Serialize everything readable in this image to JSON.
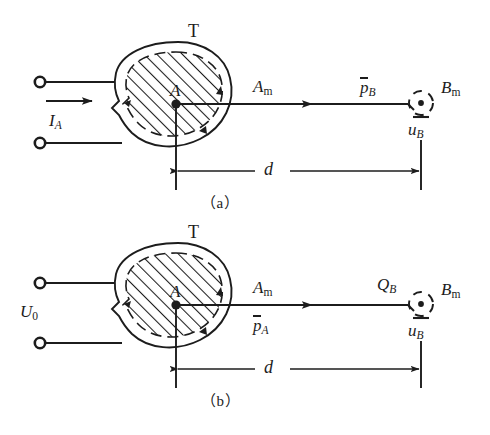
{
  "figure": {
    "type": "technical-diagram",
    "background_color": "#ffffff",
    "line_color": "#1c1c1c"
  },
  "panel_a": {
    "caption": "（a）",
    "transmitter_label": "T",
    "center_point_label": "A",
    "source_label": "I",
    "source_subscript": "A",
    "has_source_arrow": true,
    "ray_label": "A",
    "ray_subscript": "m",
    "power_label": "p",
    "power_subscript": "B",
    "power_overbar": true,
    "receiver_label": "B",
    "receiver_subscript": "m",
    "voltage_label": "u",
    "voltage_subscript": "B",
    "voltage_overbar": true,
    "distance_label": "d"
  },
  "panel_b": {
    "caption": "（b）",
    "transmitter_label": "T",
    "center_point_label": "A",
    "source_label": "U",
    "source_subscript": "0",
    "has_source_arrow": false,
    "ray_label": "A",
    "ray_subscript": "m",
    "power_label": "p",
    "power_subscript": "A",
    "power_overbar": true,
    "charge_label": "Q",
    "charge_subscript": "B",
    "receiver_label": "B",
    "receiver_subscript": "m",
    "voltage_label": "u",
    "voltage_subscript": "B",
    "voltage_overbar": true,
    "distance_label": "d"
  }
}
